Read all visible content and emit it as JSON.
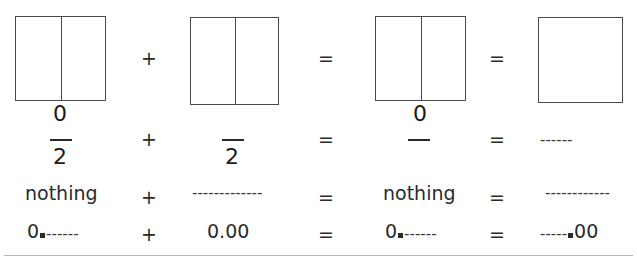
{
  "figure": {
    "bottom_rule": true
  },
  "boxes": [
    {
      "name": "box-1",
      "divided": true,
      "label_below": "0"
    },
    {
      "name": "box-2",
      "divided": true,
      "label_below": ""
    },
    {
      "name": "box-3",
      "divided": true,
      "label_below": "0"
    },
    {
      "name": "box-4",
      "divided": false,
      "label_below": ""
    }
  ],
  "operators": {
    "plus": "+",
    "equals": "="
  },
  "rows": [
    {
      "id": "row-diagram",
      "cells": [
        "box",
        "box",
        "box",
        "box"
      ],
      "operators": [
        "+",
        "=",
        "="
      ]
    },
    {
      "id": "row-fraction",
      "numerators": [
        "0",
        "",
        "0",
        ""
      ],
      "denominators": [
        "2",
        "2",
        "",
        ""
      ],
      "denominator_dashes": "------",
      "operators": [
        "+",
        "=",
        "="
      ]
    },
    {
      "id": "row-word",
      "cells": [
        "nothing",
        "-------------",
        "nothing",
        "------------"
      ],
      "operators": [
        "+",
        "=",
        "="
      ]
    },
    {
      "id": "row-decimal",
      "cells": [
        {
          "prefix": "0",
          "mark": "square",
          "dashes": "------",
          "suffix": ""
        },
        {
          "prefix": "0.00",
          "mark": "none",
          "dashes": "",
          "suffix": ""
        },
        {
          "prefix": "0",
          "mark": "square",
          "dashes": "------",
          "suffix": ""
        },
        {
          "prefix": "",
          "mark": "square",
          "dashes": "-----",
          "suffix": "00",
          "dashes_before": true
        }
      ],
      "operators": [
        "+",
        "=",
        "="
      ]
    }
  ],
  "text": {
    "zero": "0",
    "two": "2",
    "nothing": "nothing",
    "zero_point_zero_zero": "0.00",
    "double_zero": "00",
    "dashes_short": "------",
    "dashes_medium": "-----",
    "dashes_long": "-------------",
    "dashes_long_alt": "------------"
  },
  "colors": {
    "background": "#ffffff",
    "ink": "#1a1a1a",
    "box_stroke": "#4a4a4a",
    "rule": "#b9b9b9"
  }
}
